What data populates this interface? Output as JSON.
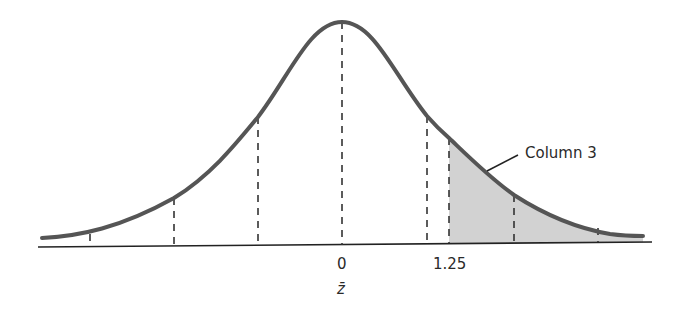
{
  "diagram": {
    "type": "normal-distribution-curve",
    "x_axis": {
      "mean_label": "0",
      "marked_value_label": "1.25",
      "variable_label": "z̄"
    },
    "shaded_region": {
      "from": "1.25",
      "to": "+∞",
      "fill_color": "#d2d2d2"
    },
    "annotation": {
      "text": "Column 3"
    },
    "colors": {
      "curve": "#555555",
      "axis": "#222222",
      "dash": "#333333"
    }
  }
}
